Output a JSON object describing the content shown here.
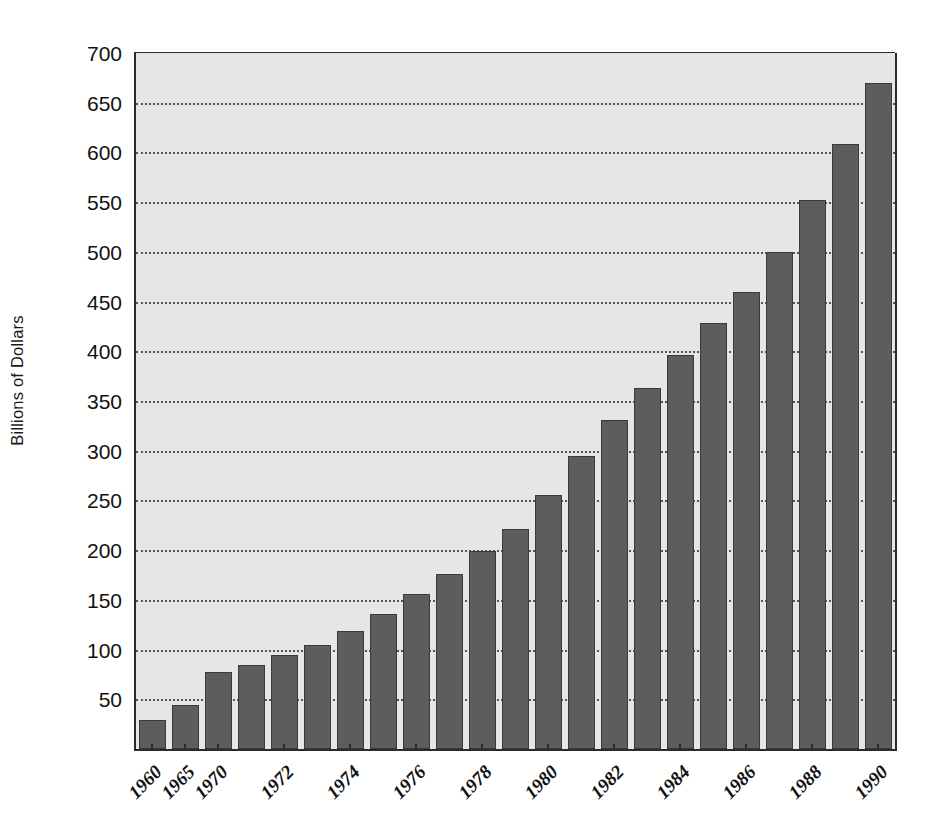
{
  "chart_data": {
    "type": "bar",
    "title": "",
    "xlabel": "",
    "ylabel": "Billions of Dollars",
    "ylim": [
      0,
      700
    ],
    "ytick_step": 50,
    "grid": true,
    "grid_style": "dotted-horizontal",
    "legend": "none",
    "bar_color": "#5d5d5d",
    "bar_edge_color": "#3a3a3a",
    "plot_background": "#e6e6e6",
    "axis_color": "#2b2b2b",
    "xtick_rotation": -45,
    "xtick_style": "italic",
    "ytick_labels": [
      "700",
      "650",
      "600",
      "550",
      "500",
      "450",
      "400",
      "350",
      "300",
      "250",
      "200",
      "150",
      "100",
      "50"
    ],
    "yticks": [
      700,
      650,
      600,
      550,
      500,
      450,
      400,
      350,
      300,
      250,
      200,
      150,
      100,
      50
    ],
    "categories": [
      "1960",
      "1965",
      "1970",
      "1971",
      "1972",
      "1973",
      "1974",
      "1975",
      "1976",
      "1977",
      "1978",
      "1979",
      "1980",
      "1981",
      "1982",
      "1983",
      "1984",
      "1985",
      "1986",
      "1987",
      "1988",
      "1989",
      "1990"
    ],
    "labeled_categories": [
      "1960",
      "1965",
      "1970",
      "1972",
      "1974",
      "1976",
      "1978",
      "1980",
      "1982",
      "1984",
      "1986",
      "1988",
      "1990"
    ],
    "values": [
      29,
      44,
      77,
      85,
      95,
      105,
      119,
      136,
      156,
      176,
      199,
      221,
      255,
      295,
      331,
      363,
      396,
      428,
      460,
      500,
      552,
      608,
      670
    ]
  }
}
